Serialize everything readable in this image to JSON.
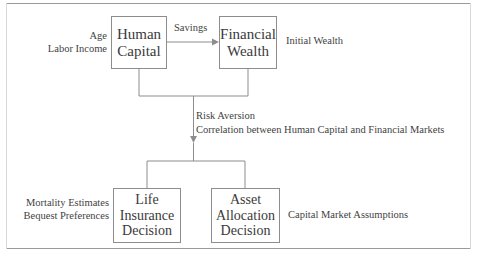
{
  "figure": {
    "type": "flow-diagram",
    "title": "",
    "frame": {
      "top_rule": true,
      "bottom_rule": true
    }
  },
  "nodes": [
    {
      "id": "human-capital",
      "lines": [
        "Human",
        "Capital"
      ],
      "x": 111,
      "y": 16,
      "w": 56,
      "h": 53
    },
    {
      "id": "financial-wealth",
      "lines": [
        "Financial",
        "Wealth"
      ],
      "x": 219,
      "y": 16,
      "w": 58,
      "h": 53
    },
    {
      "id": "life-insurance",
      "lines": [
        "Life",
        "Insurance",
        "Decision"
      ],
      "x": 113,
      "y": 188,
      "w": 68,
      "h": 55
    },
    {
      "id": "asset-allocation",
      "lines": [
        "Asset",
        "Allocation",
        "Decision"
      ],
      "x": 211,
      "y": 188,
      "w": 69,
      "h": 55
    }
  ],
  "labels": {
    "age_income": [
      "Age",
      "Labor Income"
    ],
    "initial_wealth": [
      "Initial Wealth"
    ],
    "mortality": [
      "Mortality Estimates",
      "Bequest Preferences"
    ],
    "capital_market": [
      "Capital Market Assumptions"
    ],
    "savings": "Savings",
    "risk": [
      "Risk Aversion",
      "Correlation between Human Capital and Financial Markets"
    ]
  },
  "edges": [
    {
      "id": "savings-arrow",
      "from": "human-capital",
      "to": "financial-wealth",
      "label": "Savings",
      "arrow": true
    },
    {
      "id": "merge-down",
      "from": [
        "human-capital",
        "financial-wealth"
      ],
      "to": "decisions-bus",
      "arrow": true
    },
    {
      "id": "split-to-life-insurance",
      "from": "decisions-bus",
      "to": "life-insurance",
      "arrow": false
    },
    {
      "id": "split-to-asset-allocation",
      "from": "decisions-bus",
      "to": "asset-allocation",
      "arrow": false
    }
  ],
  "colors": {
    "stroke": "#8d8d8d",
    "text": "#3a3a3a",
    "background": "#ffffff",
    "rule": "#9a9a9a"
  }
}
